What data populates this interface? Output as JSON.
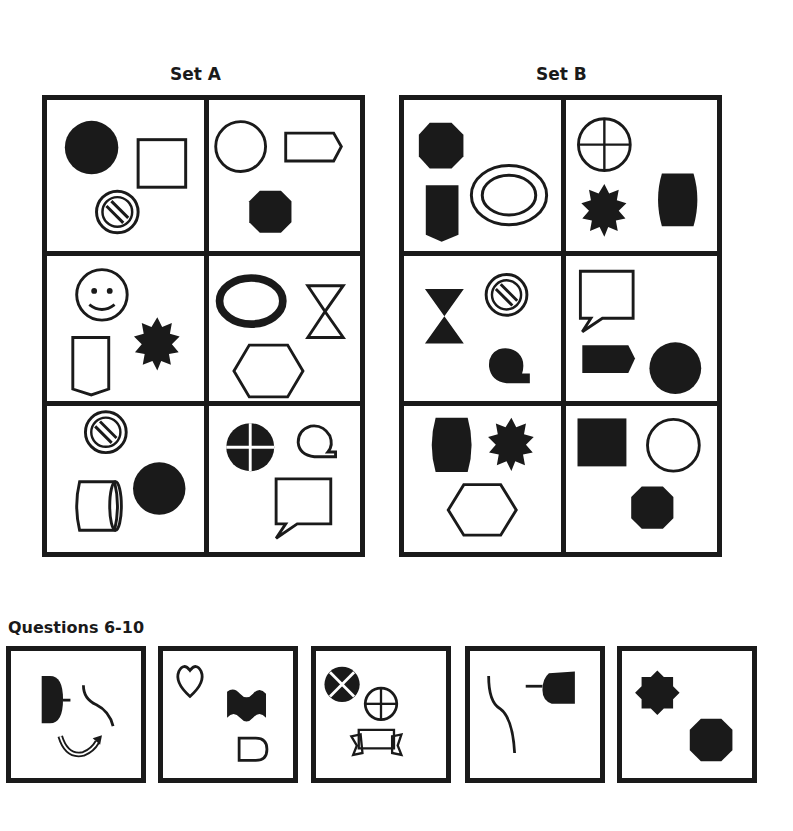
{
  "set_a": {
    "title": "Set A",
    "cells": [
      {
        "shapes": [
          "filled-circle",
          "outline-square",
          "striped-circle"
        ]
      },
      {
        "shapes": [
          "outline-circle",
          "outline-arrow-pentagon",
          "filled-octagon"
        ]
      },
      {
        "shapes": [
          "smiley-face",
          "outline-shield",
          "filled-starburst"
        ]
      },
      {
        "shapes": [
          "thick-outline-ellipse",
          "outline-hourglass",
          "outline-hexagon"
        ]
      },
      {
        "shapes": [
          "striped-circle",
          "outline-cylinder",
          "filled-circle"
        ]
      },
      {
        "shapes": [
          "filled-quartered-circle",
          "outline-speech-loop",
          "outline-speech-bubble"
        ]
      }
    ]
  },
  "set_b": {
    "title": "Set B",
    "cells": [
      {
        "shapes": [
          "filled-octagon",
          "filled-shield",
          "double-outline-ellipse"
        ]
      },
      {
        "shapes": [
          "outline-crosshair-circle",
          "filled-starburst",
          "filled-barrel"
        ]
      },
      {
        "shapes": [
          "filled-hourglass",
          "striped-circle",
          "filled-speech-loop"
        ]
      },
      {
        "shapes": [
          "outline-speech-bubble",
          "filled-arrow-pentagon",
          "filled-circle"
        ]
      },
      {
        "shapes": [
          "filled-barrel",
          "filled-starburst",
          "outline-hexagon"
        ]
      },
      {
        "shapes": [
          "filled-square",
          "outline-circle",
          "filled-octagon"
        ]
      }
    ]
  },
  "questions": {
    "title": "Questions 6-10",
    "items": [
      {
        "number": 6,
        "shapes": [
          "filled-half-disc-with-stem",
          "s-curve-line",
          "curved-arrow"
        ]
      },
      {
        "number": 7,
        "shapes": [
          "outline-heart",
          "filled-wavy-band",
          "outline-bullet-shape"
        ]
      },
      {
        "number": 8,
        "shapes": [
          "filled-x-circle",
          "outline-crosshair-circle",
          "outline-ribbon-banner"
        ]
      },
      {
        "number": 9,
        "shapes": [
          "s-curve-line",
          "filled-cap-with-stem"
        ]
      },
      {
        "number": 10,
        "shapes": [
          "filled-eight-point-star",
          "filled-octagon"
        ]
      }
    ]
  },
  "colors": {
    "ink": "#1a1a1a",
    "background": "#ffffff"
  }
}
